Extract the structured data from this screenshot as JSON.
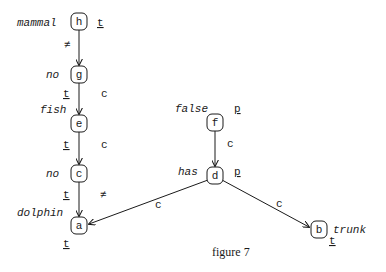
{
  "figure": {
    "caption": "figure 7",
    "nodes": [
      {
        "id": "h",
        "x": 79,
        "y": 22,
        "label": "mammal",
        "mark": "t"
      },
      {
        "id": "g",
        "x": 79,
        "y": 74,
        "label": "no",
        "mark": "t"
      },
      {
        "id": "e",
        "x": 79,
        "y": 123,
        "label": "fish",
        "mark": "t"
      },
      {
        "id": "c",
        "x": 79,
        "y": 173,
        "label": "no",
        "mark": "t"
      },
      {
        "id": "a",
        "x": 79,
        "y": 225,
        "label": "dolphin",
        "mark": "t"
      },
      {
        "id": "f",
        "x": 215,
        "y": 122,
        "label": "false",
        "mark": "p"
      },
      {
        "id": "d",
        "x": 215,
        "y": 175,
        "label": "has",
        "mark": "p"
      },
      {
        "id": "b",
        "x": 319,
        "y": 229,
        "label": "trunk",
        "mark": "t"
      }
    ],
    "edges": [
      {
        "from": "h",
        "to": "g",
        "label": "≠"
      },
      {
        "from": "g",
        "to": "e",
        "label": "c"
      },
      {
        "from": "e",
        "to": "c",
        "label": "c"
      },
      {
        "from": "c",
        "to": "a",
        "label": "≠"
      },
      {
        "from": "f",
        "to": "d",
        "label": "c"
      },
      {
        "from": "d",
        "to": "a",
        "label": "c"
      },
      {
        "from": "d",
        "to": "b",
        "label": "c"
      }
    ]
  }
}
